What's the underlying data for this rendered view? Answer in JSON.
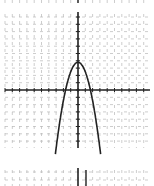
{
  "chart_data": {
    "type": "line",
    "title": "",
    "xlabel": "x",
    "ylabel": "y",
    "function": "y = 4 - 1.4x^2",
    "vertex": [
      0,
      4
    ],
    "x_intercepts": [
      -1.7,
      1.7
    ],
    "xlim": [
      -10,
      10
    ],
    "ylim": [
      -8,
      10
    ],
    "grid": true,
    "tick_step": 1,
    "series": [
      {
        "name": "parabola",
        "x": [
          -3.1,
          -2.5,
          -2,
          -1.5,
          -1,
          -0.5,
          0,
          0.5,
          1,
          1.5,
          2,
          2.5,
          3.1
        ],
        "values": [
          -9.5,
          -4.75,
          -1.6,
          0.85,
          2.6,
          3.65,
          4,
          3.65,
          2.6,
          0.85,
          -1.6,
          -4.75,
          -9.5
        ]
      }
    ],
    "colors": {
      "grid": "#b8b8b8",
      "axis": "#222222",
      "curve": "#222222"
    }
  }
}
